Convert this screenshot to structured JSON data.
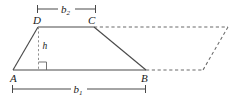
{
  "figure": {
    "type": "geometry-diagram",
    "vertices": [
      {
        "name": "A",
        "label": "A",
        "x": 13,
        "y": 70,
        "label_x": 11,
        "label_y": 81
      },
      {
        "name": "B",
        "label": "B",
        "x": 146,
        "y": 70,
        "label_x": 142,
        "label_y": 81
      },
      {
        "name": "C",
        "label": "C",
        "x": 94,
        "y": 27,
        "label_x": 89,
        "label_y": 24
      },
      {
        "name": "D",
        "label": "D",
        "x": 38,
        "y": 27,
        "label_x": 34,
        "label_y": 24
      }
    ],
    "height": {
      "label": "h",
      "label_x": 43,
      "label_y": 49,
      "foot_x": 38,
      "foot_y": 70,
      "top_x": 38,
      "top_y": 27
    },
    "right_angle_marker": {
      "x": 38,
      "y": 62,
      "size": 8
    },
    "dimensions": [
      {
        "name": "b2",
        "base": "b",
        "subscript": "2",
        "y": 9,
        "x_start": 37,
        "x_end": 96,
        "label_x": 66,
        "label_y": 12
      },
      {
        "name": "b1",
        "base": "b",
        "subscript": "1",
        "y": 89,
        "x_start": 12,
        "x_end": 146,
        "label_x": 78,
        "label_y": 92
      }
    ],
    "dashed_extension": {
      "top_y": 27,
      "top_x_start": 94,
      "top_x_end": 228,
      "bottom_y": 70,
      "bottom_x_start": 146,
      "bottom_x_end": 203,
      "slant_top_x": 228,
      "slant_bottom_x": 203
    },
    "colors": {
      "solid_line": "#4a4a4a",
      "dashed_line": "#6b6b6b",
      "height_line": "#8a8a8a",
      "dimension_line": "#3f3f3f",
      "label_text": "#1a1a1a",
      "background": "#ffffff"
    }
  }
}
